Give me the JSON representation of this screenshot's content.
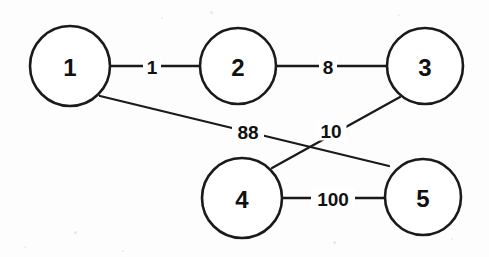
{
  "diagram": {
    "background_color": "#fdfdfd",
    "stroke_color": "#1a1a1a",
    "width": 489,
    "height": 257
  },
  "nodes": [
    {
      "id": "1",
      "label": "1",
      "cx": 70,
      "cy": 66,
      "r": 40
    },
    {
      "id": "2",
      "label": "2",
      "cx": 238,
      "cy": 66,
      "r": 38
    },
    {
      "id": "3",
      "label": "3",
      "cx": 425,
      "cy": 66,
      "r": 38
    },
    {
      "id": "4",
      "label": "4",
      "cx": 242,
      "cy": 198,
      "r": 40
    },
    {
      "id": "5",
      "label": "5",
      "cx": 423,
      "cy": 197,
      "r": 38
    }
  ],
  "edges": [
    {
      "id": "edge-1-2",
      "source": "1",
      "target": "2",
      "weight": "1",
      "x1": 110,
      "y1": 66,
      "x2": 200,
      "y2": 66,
      "label_x": 152,
      "label_y": 66,
      "label_w": 18,
      "label_h": 20
    },
    {
      "id": "edge-2-3",
      "source": "2",
      "target": "3",
      "weight": "8",
      "x1": 276,
      "y1": 66,
      "x2": 387,
      "y2": 66,
      "label_x": 328,
      "label_y": 66,
      "label_w": 18,
      "label_h": 20
    },
    {
      "id": "edge-1-5",
      "source": "1",
      "target": "5",
      "weight": "88",
      "x1": 100,
      "y1": 96,
      "x2": 389,
      "y2": 166,
      "label_x": 248,
      "label_y": 131,
      "label_w": 32,
      "label_h": 21
    },
    {
      "id": "edge-3-4",
      "source": "3",
      "target": "4",
      "weight": "10",
      "x1": 400,
      "y1": 97,
      "x2": 272,
      "y2": 168,
      "label_x": 331,
      "label_y": 130,
      "label_w": 31,
      "label_h": 21
    },
    {
      "id": "edge-4-5",
      "source": "4",
      "target": "5",
      "weight": "100",
      "x1": 282,
      "y1": 198,
      "x2": 385,
      "y2": 198,
      "label_x": 333,
      "label_y": 198,
      "label_w": 44,
      "label_h": 20
    }
  ],
  "specks": [
    {
      "x": 74,
      "y": 231,
      "size": 3
    },
    {
      "x": 24,
      "y": 246,
      "size": 2
    },
    {
      "x": 210,
      "y": 11,
      "size": 3
    },
    {
      "x": 333,
      "y": 241,
      "size": 3
    },
    {
      "x": 161,
      "y": 17,
      "size": 2
    },
    {
      "x": 451,
      "y": 238,
      "size": 2
    },
    {
      "x": 122,
      "y": 250,
      "size": 2
    },
    {
      "x": 398,
      "y": 14,
      "size": 2
    }
  ]
}
